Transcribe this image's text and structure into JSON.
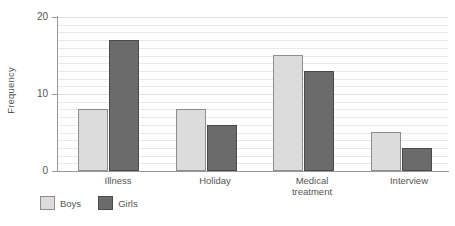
{
  "chart_data": {
    "type": "bar",
    "title": "",
    "subtitle": "",
    "xlabel": "",
    "ylabel": "Frequency",
    "categories": [
      "Illness",
      "Holiday",
      "Medical treatment",
      "Interview"
    ],
    "series": [
      {
        "name": "Boys",
        "values": [
          8,
          8,
          15,
          5
        ],
        "color": "#dcdcdc"
      },
      {
        "name": "Girls",
        "values": [
          17,
          6,
          13,
          3
        ],
        "color": "#6b6b6b"
      }
    ],
    "ylim": [
      0,
      20
    ],
    "y_ticks": [
      0,
      10,
      20
    ],
    "y_tick_labels": [
      "0",
      "10",
      "20"
    ],
    "grid": true,
    "grid_interval": 1,
    "legend_position": "bottom-left"
  },
  "axes": {
    "y_title": "Frequency",
    "y_tick_0": "0",
    "y_tick_10": "10",
    "y_tick_20": "20"
  },
  "categories": {
    "cat0_line1": "Illness",
    "cat0_line2": "",
    "cat1_line1": "Holiday",
    "cat1_line2": "",
    "cat2_line1": "Medical",
    "cat2_line2": "treatment",
    "cat3_line1": "Interview",
    "cat3_line2": ""
  },
  "legend": {
    "boys_label": "Boys",
    "girls_label": "Girls"
  },
  "colors": {
    "boys_fill": "#dcdcdc",
    "boys_stroke": "#8e8e8e",
    "girls_fill": "#6b6b6b",
    "girls_stroke": "#4a4a4a",
    "axis": "#9a9a9a",
    "grid": "#e9e9e9",
    "text": "#555555",
    "background": "#ffffff"
  }
}
